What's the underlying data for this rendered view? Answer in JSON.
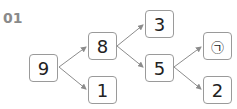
{
  "problem_number": "01",
  "nodes": {
    "root": "9",
    "a": "8",
    "b": "1",
    "c": "3",
    "d": "5",
    "e": "㉠",
    "f": "2"
  },
  "colors": {
    "edge": "#8c8c8c",
    "border": "#9a9a9a",
    "label": "#8a8a8a"
  }
}
